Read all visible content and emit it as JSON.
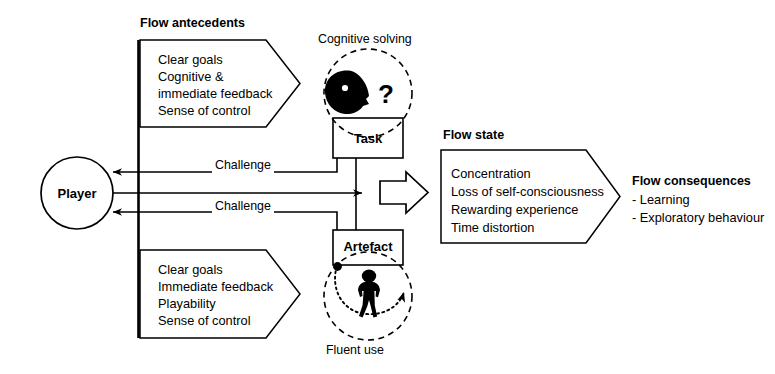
{
  "diagram": {
    "title_antecedents": "Flow antecedents",
    "title_flow_state": "Flow state",
    "antecedents_top": {
      "lines": [
        "Clear goals",
        "Cognitive &",
        "immediate feedback",
        "Sense of control"
      ]
    },
    "antecedents_bottom": {
      "lines": [
        "Clear goals",
        "Immediate feedback",
        "Playability",
        "Sense of control"
      ]
    },
    "flow_state": {
      "lines": [
        "Concentration",
        "Loss of self-consciousness",
        "Rewarding experience",
        "Time distortion"
      ]
    },
    "consequences": {
      "title": "Flow consequences",
      "items": [
        "- Learning",
        "- Exploratory behaviour"
      ]
    },
    "player": {
      "label": "Player"
    },
    "task": {
      "label": "Task",
      "caption": "Cognitive solving",
      "glyph": "?"
    },
    "artefact": {
      "label": "Artefact",
      "caption": "Fluent use"
    },
    "edges": {
      "challenge_top": "Challenge",
      "challenge_bottom": "Challenge"
    },
    "colors": {
      "stroke": "#000000",
      "background": "#ffffff",
      "fill_silhouette": "#000000"
    }
  }
}
